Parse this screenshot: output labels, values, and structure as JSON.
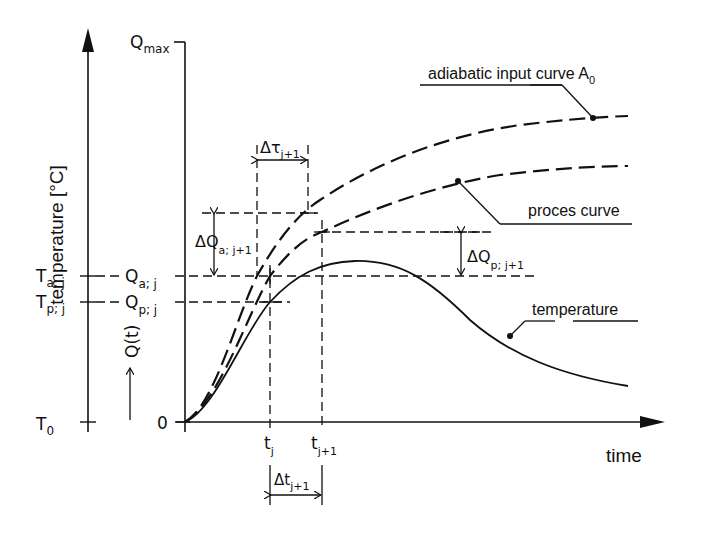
{
  "axes": {
    "temperature_axis_label": "temperature [°C]",
    "q_axis_label": "Q(t)",
    "q_axis_arrow": "→",
    "time_axis_label": "time",
    "q_max": {
      "main": "Q",
      "sub": "max"
    },
    "t0": {
      "main": "T",
      "sub": "0"
    },
    "q_zero": "0"
  },
  "levels": {
    "T_a_j": {
      "main": "T",
      "sub": "a; j"
    },
    "T_p_j": {
      "main": "T",
      "sub": "p; j"
    },
    "Q_a_j": {
      "main": "Q",
      "sub": "a; j"
    },
    "Q_p_j": {
      "main": "Q",
      "sub": "p; j"
    }
  },
  "time_marks": {
    "t_j": {
      "main": "t",
      "sub": "j"
    },
    "t_j1": {
      "main": "t",
      "sub": "j+1"
    },
    "delta_t": {
      "main": "Δt",
      "sub": "j+1"
    },
    "delta_tau": {
      "main": "Δτ",
      "sub": "j+1"
    }
  },
  "deltas": {
    "delta_Q_a": {
      "main": "ΔQ",
      "sub": "a; j+1"
    },
    "delta_Q_p": {
      "main": "ΔQ",
      "sub": "p; j+1"
    }
  },
  "curves": {
    "adiabatic": {
      "label": "adiabatic input curve A",
      "sub": "0",
      "style": "dashed"
    },
    "process": {
      "label": "proces curve",
      "style": "dashed"
    },
    "temperature": {
      "label": "temperature",
      "style": "solid"
    }
  },
  "colors": {
    "ink": "#111111",
    "background": "#ffffff"
  }
}
